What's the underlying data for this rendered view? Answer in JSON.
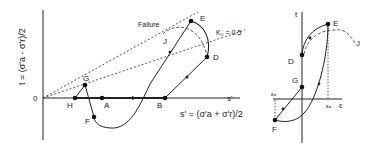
{
  "left_plot": {
    "y_axis_label": "t = (σ'a - σ'r)/2",
    "x_axis_short": "s'",
    "x_axis_label": "s' = (σ'a + σ'r)/2",
    "origin_label": "0",
    "failure_line_label": "Failure",
    "k0_line_label": "K₀ = 0.5",
    "points": {
      "A": "A",
      "B": "B",
      "D": "D",
      "E": "E",
      "F": "F",
      "G": "G",
      "H": "H",
      "J": "J"
    }
  },
  "right_plot": {
    "y_axis_label": "t",
    "x_axis_label": "ε",
    "strain_left": "εₐ",
    "strain_right": "εₐ",
    "points": {
      "D": "D",
      "E": "E",
      "F": "F",
      "G": "G",
      "J": "J"
    }
  },
  "colors": {
    "line": "#222222",
    "dotted": "#444444",
    "background": "#ffffff"
  }
}
